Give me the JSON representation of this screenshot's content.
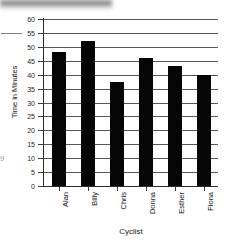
{
  "chart_data": {
    "type": "bar",
    "title": "",
    "xlabel": "Cyclist",
    "ylabel": "Time in Minutes",
    "categories": [
      "Alan",
      "Billy",
      "Chris",
      "Donna",
      "Esther",
      "Fiona"
    ],
    "values": [
      48,
      52,
      37.5,
      46,
      43,
      40
    ],
    "ylim": [
      0,
      60
    ],
    "ytick_labels": [
      "60",
      "55",
      "50",
      "45",
      "40",
      "35",
      "30",
      "25",
      "20",
      "15",
      "10",
      "5",
      "0"
    ],
    "ytick_values": [
      60,
      55,
      50,
      45,
      40,
      35,
      30,
      25,
      20,
      15,
      10,
      5,
      0
    ],
    "grid": true,
    "legend": false,
    "bar_color": "#050505",
    "grid_color": "#565656",
    "axis_color": "#2b2b2b"
  },
  "artifacts": {
    "edge_glyph": "9"
  }
}
